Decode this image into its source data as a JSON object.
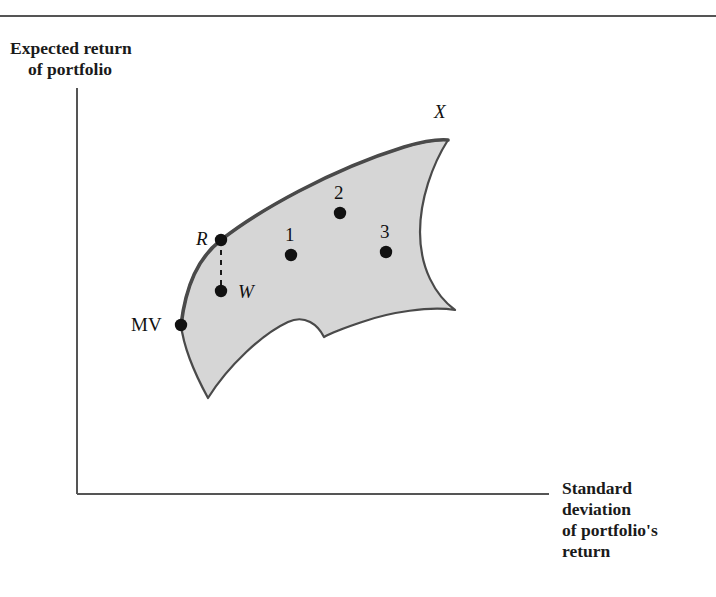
{
  "figure": {
    "kind": "efficient-frontier-diagram",
    "top_rule": true,
    "background_color": "#ffffff"
  },
  "axes": {
    "y": {
      "label_line1": "Expected return",
      "label_line2": "of portfolio",
      "color": "#555555"
    },
    "x": {
      "label_line1": "Standard",
      "label_line2": "deviation",
      "label_line3": "of portfolio's",
      "label_line4": "return",
      "color": "#555555"
    }
  },
  "region": {
    "name": "feasible-set",
    "fill_color": "#d6d6d6",
    "stroke_color": "#4a4a4a"
  },
  "points": [
    {
      "id": "MV",
      "label": "MV",
      "italic": false,
      "x": 181,
      "y": 325,
      "label_x": 131,
      "label_y": 314
    },
    {
      "id": "R",
      "label": "R",
      "italic": true,
      "x": 221,
      "y": 240,
      "label_x": 196,
      "label_y": 228
    },
    {
      "id": "W",
      "label": "W",
      "italic": true,
      "x": 221,
      "y": 291,
      "label_x": 238,
      "label_y": 281
    },
    {
      "id": "X",
      "label": "X",
      "italic": true,
      "x": 448,
      "y": 140,
      "label_x": 434,
      "label_y": 101
    },
    {
      "id": "1",
      "label": "1",
      "italic": false,
      "x": 291,
      "y": 255,
      "label_x": 285,
      "label_y": 224
    },
    {
      "id": "2",
      "label": "2",
      "italic": false,
      "x": 340,
      "y": 213,
      "label_x": 334,
      "label_y": 182
    },
    {
      "id": "3",
      "label": "3",
      "italic": false,
      "x": 386,
      "y": 252,
      "label_x": 380,
      "label_y": 221
    }
  ],
  "chart_data": {
    "type": "scatter",
    "title": "",
    "xlabel": "Standard deviation of portfolio's return",
    "ylabel": "Expected return of portfolio",
    "grid": false,
    "legend": null,
    "annotations": [
      "MV",
      "R",
      "W",
      "X",
      "1",
      "2",
      "3"
    ],
    "series": [
      {
        "name": "labeled portfolios",
        "points": [
          {
            "label": "MV",
            "x": 181,
            "y": 325
          },
          {
            "label": "R",
            "x": 221,
            "y": 240
          },
          {
            "label": "W",
            "x": 221,
            "y": 291
          },
          {
            "label": "1",
            "x": 291,
            "y": 255
          },
          {
            "label": "2",
            "x": 340,
            "y": 213
          },
          {
            "label": "3",
            "x": 386,
            "y": 252
          }
        ]
      }
    ],
    "connector": {
      "from": "R",
      "to": "W",
      "style": "dashed"
    },
    "frontier": {
      "from": "MV",
      "to": "X",
      "style": "solid-bold-upper-boundary"
    }
  }
}
